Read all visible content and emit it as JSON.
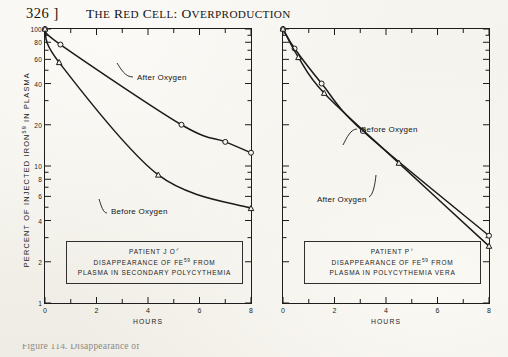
{
  "page": {
    "folio": "326 ]",
    "running_title_lead": "T",
    "running_title_rest": "HE ",
    "running_title_full": "THE RED CELL: OVERPRODUCTION",
    "caption_fragment": "Figure 114. Disappearance of"
  },
  "axes": {
    "y_label_pre": "PERCENT OF INJECTED IRON",
    "y_label_sup": "59",
    "y_label_post": " IN PLASMA",
    "y_ticks": [
      "100",
      "80",
      "60",
      "40",
      "20",
      "10",
      "8",
      "6",
      "4",
      "2",
      "1"
    ],
    "y_min": 1,
    "y_max": 100,
    "x_label": "HOURS",
    "x_ticks": [
      "0",
      "2",
      "4",
      "6",
      "8"
    ],
    "x_min": 0,
    "x_max": 8
  },
  "left_panel": {
    "info": {
      "line1_pre": "PATIENT J O",
      "line1_symbol": "♂",
      "line2_pre": "DISAPPEARANCE OF FE",
      "line2_sup": "59",
      "line2_post": " FROM",
      "line3": "PLASMA IN SECONDARY POLYCYTHEMIA"
    },
    "labels": {
      "upper": "After  Oxygen",
      "lower": "Before  Oxygen"
    }
  },
  "right_panel": {
    "info": {
      "line1_pre": "PATIENT P",
      "line1_symbol": "♀",
      "line2_pre": "DISAPPEARANCE OF FE",
      "line2_sup": "59",
      "line2_post": " FROM",
      "line3": "PLASMA IN POLYCYTHEMIA VERA"
    },
    "labels": {
      "upper": "Before  Oxygen",
      "lower": "After  Oxygen"
    }
  },
  "chart_data": [
    {
      "type": "line",
      "panel": "left",
      "title": "PATIENT J O♂ — DISAPPEARANCE OF FE59 FROM PLASMA IN SECONDARY POLYCYTHEMIA",
      "xlabel": "HOURS",
      "ylabel": "PERCENT OF INJECTED IRON59 IN PLASMA",
      "yscale": "log",
      "xlim": [
        0,
        8
      ],
      "ylim": [
        1,
        100
      ],
      "grid": false,
      "legend": "inline-annotations",
      "series": [
        {
          "name": "After Oxygen",
          "marker": "circle",
          "x": [
            0,
            0.6,
            5.3,
            7.0,
            8.0
          ],
          "y": [
            100,
            77,
            20,
            15,
            12.5
          ]
        },
        {
          "name": "Before Oxygen",
          "marker": "triangle",
          "x": [
            0,
            0.55,
            4.4,
            8.0
          ],
          "y": [
            100,
            57,
            8.6,
            4.9
          ]
        }
      ]
    },
    {
      "type": "line",
      "panel": "right",
      "title": "PATIENT P♀ — DISAPPEARANCE OF FE59 FROM PLASMA IN POLYCYTHEMIA VERA",
      "xlabel": "HOURS",
      "ylabel": "PERCENT OF INJECTED IRON59 IN PLASMA",
      "yscale": "log",
      "xlim": [
        0,
        8
      ],
      "ylim": [
        1,
        100
      ],
      "grid": false,
      "legend": "inline-annotations",
      "series": [
        {
          "name": "Before Oxygen",
          "marker": "circle",
          "x": [
            0,
            0.45,
            1.5,
            3.1,
            8.0
          ],
          "y": [
            100,
            72,
            40,
            18,
            3.1
          ]
        },
        {
          "name": "After Oxygen",
          "marker": "triangle",
          "x": [
            0,
            0.6,
            1.6,
            4.5,
            8.0
          ],
          "y": [
            100,
            62,
            34,
            10.5,
            2.6
          ]
        }
      ]
    }
  ]
}
